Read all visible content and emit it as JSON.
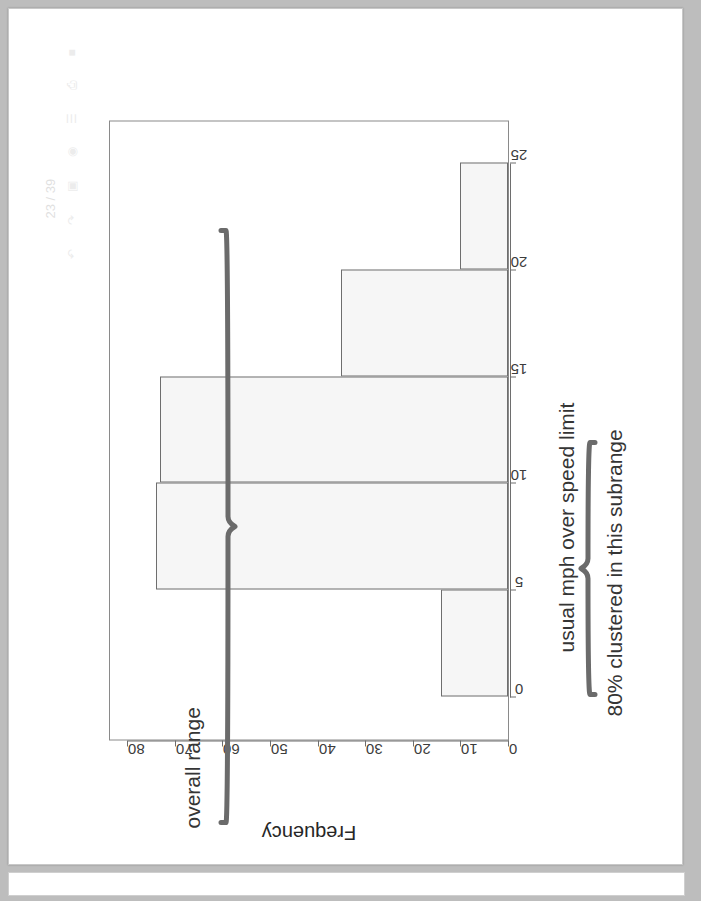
{
  "viewer": {
    "page_indicator": "23 / 39",
    "toolbar_icons": [
      "undo-icon",
      "redo-icon",
      "hand-icon",
      "zoom-icon",
      "list-icon",
      "print-icon",
      "fit-page-icon"
    ]
  },
  "annotations": {
    "overall_range": "overall range",
    "subrange_note": "80% clustered in this subrange"
  },
  "chart_data": {
    "type": "bar",
    "title": "",
    "subtitle": "",
    "xlabel": "usual mph over speed limit",
    "ylabel": "Frequency",
    "orientation": "rotated-90-ccw",
    "bin_width": 5,
    "bin_edges": [
      0,
      5,
      10,
      15,
      20,
      25
    ],
    "categories": [
      "0-5",
      "5-10",
      "10-15",
      "15-20",
      "20-25"
    ],
    "values": [
      14,
      74,
      73,
      35,
      10
    ],
    "x_ticks": [
      0,
      5,
      10,
      15,
      20,
      25
    ],
    "x_tick_labels": [
      "0",
      "5",
      "10",
      "15",
      "20",
      "25"
    ],
    "y_ticks": [
      0,
      10,
      20,
      30,
      40,
      50,
      60,
      70,
      80
    ],
    "y_tick_labels": [
      "0",
      "10",
      "20",
      "30",
      "40",
      "50",
      "60",
      "70",
      "80"
    ],
    "xlim": [
      -2,
      27
    ],
    "ylim": [
      0,
      84
    ],
    "grid": false,
    "legend": null,
    "bar_fill": "#f6f6f6",
    "bar_stroke": "#6e6e6e",
    "annotation_brackets": [
      {
        "label": "overall range",
        "from": 0,
        "to": 25
      },
      {
        "label": "80% clustered in this subrange",
        "from": 5,
        "to": 15
      }
    ]
  }
}
